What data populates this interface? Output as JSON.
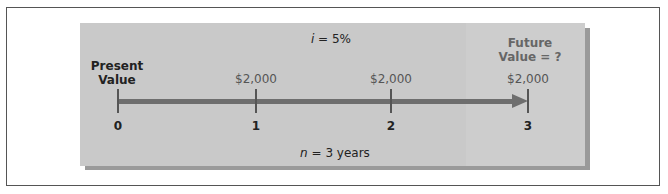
{
  "diagram": {
    "type": "timeline",
    "interest_label": "i = 5%",
    "interest_var": "i",
    "interest_rest": " = 5%",
    "periods_var": "n",
    "periods_rest": " = 3 years",
    "present_value_label": [
      "Present",
      "Value"
    ],
    "future_value_label": [
      "Future",
      "Value = ?"
    ],
    "points": [
      {
        "period": "0",
        "payment": ""
      },
      {
        "period": "1",
        "payment": "$2,000"
      },
      {
        "period": "2",
        "payment": "$2,000"
      },
      {
        "period": "3",
        "payment": "$2,000"
      }
    ],
    "colors": {
      "panel": "#c9c9c9",
      "panel_shadow": "#9a9a9a",
      "axis": "#6e6e6e",
      "future_value_text": "#666666"
    }
  }
}
